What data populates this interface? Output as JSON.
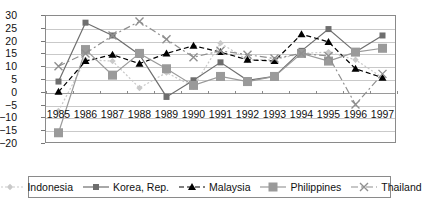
{
  "chart_data": {
    "type": "line",
    "title": "",
    "subtitle": "",
    "xlabel": "",
    "ylabel": "",
    "grid": true,
    "legend_position": "bottom",
    "categories": [
      "1985",
      "1986",
      "1987",
      "1988",
      "1989",
      "1990",
      "1991",
      "1992",
      "1993",
      "1994",
      "1995",
      "1996",
      "1997"
    ],
    "x": [
      1985,
      1986,
      1987,
      1988,
      1989,
      1990,
      1991,
      1992,
      1993,
      1994,
      1995,
      1996,
      1997
    ],
    "ylim": [
      -20,
      30
    ],
    "ytick_labels": [
      "30",
      "25",
      "20",
      "15",
      "10",
      "5",
      "0",
      "−5",
      "−10",
      "−15",
      "−20"
    ],
    "ytick_values": [
      30,
      25,
      20,
      15,
      10,
      5,
      0,
      -5,
      -10,
      -15,
      -20
    ],
    "series": [
      {
        "name": "Indonesia",
        "color": "#c9c9c9",
        "marker": "diamond",
        "dash": "dotted",
        "values": [
          -7.5,
          12.5,
          12.0,
          1.5,
          7.5,
          2.0,
          19.0,
          12.5,
          12.5,
          15.0,
          15.5,
          12.5,
          5.5
        ]
      },
      {
        "name": "Korea, Rep.",
        "color": "#6e6e6e",
        "marker": "square",
        "dash": "solid",
        "values": [
          4.0,
          27.0,
          22.0,
          14.5,
          -2.0,
          4.5,
          11.5,
          4.5,
          6.0,
          16.0,
          24.5,
          15.5,
          22.0
        ]
      },
      {
        "name": "Malaysia",
        "color": "#000000",
        "marker": "triangle",
        "dash": "dashed",
        "values": [
          0.0,
          12.0,
          14.5,
          11.0,
          15.0,
          18.0,
          15.5,
          12.5,
          12.0,
          22.5,
          19.5,
          9.0,
          5.5
        ]
      },
      {
        "name": "Philippines",
        "color": "#9a9a9a",
        "marker": "bigsquare",
        "dash": "solid",
        "values": [
          -16.0,
          16.5,
          6.5,
          15.0,
          9.0,
          2.5,
          6.0,
          4.0,
          6.0,
          15.0,
          12.0,
          15.5,
          17.0
        ]
      },
      {
        "name": "Thailand",
        "color": "#8f8f8f",
        "marker": "cross",
        "dash": "dashdot",
        "values": [
          10.0,
          15.0,
          22.0,
          27.5,
          20.5,
          13.5,
          16.0,
          14.5,
          13.0,
          15.0,
          14.0,
          -5.0,
          7.0
        ]
      }
    ]
  },
  "legend": {
    "items": [
      {
        "label": "Indonesia"
      },
      {
        "label": "Korea, Rep."
      },
      {
        "label": "Malaysia"
      },
      {
        "label": "Philippines"
      },
      {
        "label": "Thailand"
      }
    ]
  }
}
